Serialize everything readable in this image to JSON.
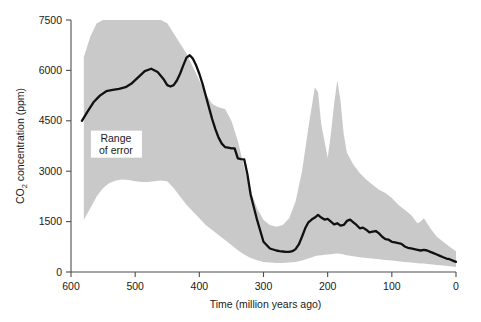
{
  "chart_data": {
    "type": "area",
    "title": "",
    "xlabel": "Time (million years ago)",
    "ylabel": "CO2 concentration (ppm)",
    "ylabel_parts": {
      "prefix": "CO",
      "sub": "2",
      "suffix": " concentration (ppm)"
    },
    "xlim": [
      600,
      0
    ],
    "ylim": [
      0,
      7500
    ],
    "x_reversed": true,
    "grid": false,
    "legend": "none",
    "xticks": [
      600,
      500,
      400,
      300,
      200,
      100,
      0
    ],
    "xtick_labels": [
      "600",
      "500",
      "400",
      "300",
      "200",
      "100",
      "0"
    ],
    "yticks": [
      0,
      1500,
      3000,
      4500,
      6000,
      7500
    ],
    "ytick_labels": [
      "0",
      "1500",
      "3000",
      "4500",
      "6000",
      "7500"
    ],
    "annotations": [
      {
        "text_line1": "Range",
        "text_line2": "of error",
        "x": 530,
        "y": 3850
      }
    ],
    "series": [
      {
        "name": "CO2 concentration (best estimate)",
        "color": "#111111",
        "x": [
          583,
          575,
          565,
          555,
          545,
          535,
          525,
          515,
          505,
          495,
          485,
          475,
          465,
          455,
          450,
          445,
          440,
          435,
          430,
          425,
          420,
          415,
          410,
          405,
          400,
          395,
          390,
          385,
          380,
          375,
          370,
          365,
          360,
          355,
          350,
          345,
          340,
          335,
          330,
          325,
          320,
          310,
          300,
          290,
          280,
          275,
          270,
          265,
          260,
          255,
          250,
          245,
          240,
          235,
          230,
          225,
          220,
          215,
          210,
          205,
          200,
          195,
          190,
          185,
          180,
          175,
          170,
          165,
          160,
          155,
          150,
          145,
          140,
          135,
          130,
          125,
          120,
          115,
          110,
          105,
          100,
          95,
          90,
          85,
          80,
          75,
          70,
          65,
          60,
          55,
          50,
          45,
          40,
          35,
          30,
          25,
          20,
          15,
          10,
          5,
          0
        ],
        "values": [
          4500,
          4750,
          5050,
          5250,
          5380,
          5420,
          5450,
          5500,
          5620,
          5800,
          5980,
          6050,
          5950,
          5720,
          5560,
          5520,
          5560,
          5700,
          5900,
          6150,
          6380,
          6450,
          6350,
          6150,
          5900,
          5600,
          5250,
          4900,
          4550,
          4250,
          4000,
          3820,
          3720,
          3700,
          3680,
          3680,
          3380,
          3360,
          3350,
          2900,
          2300,
          1550,
          900,
          700,
          640,
          620,
          610,
          600,
          600,
          620,
          680,
          820,
          1050,
          1300,
          1480,
          1560,
          1620,
          1700,
          1620,
          1560,
          1580,
          1500,
          1420,
          1450,
          1380,
          1400,
          1520,
          1560,
          1480,
          1400,
          1300,
          1320,
          1260,
          1180,
          1200,
          1220,
          1150,
          1050,
          980,
          960,
          900,
          880,
          860,
          840,
          760,
          720,
          700,
          680,
          660,
          640,
          660,
          640,
          600,
          560,
          520,
          480,
          440,
          400,
          380,
          340,
          300
        ]
      }
    ],
    "band": {
      "name": "Range of error",
      "color": "#c9c9c9",
      "x": [
        580,
        570,
        560,
        550,
        540,
        530,
        520,
        510,
        500,
        490,
        480,
        470,
        460,
        450,
        440,
        430,
        420,
        410,
        400,
        390,
        380,
        370,
        360,
        350,
        340,
        330,
        320,
        310,
        300,
        290,
        280,
        270,
        260,
        250,
        240,
        230,
        220,
        215,
        210,
        205,
        200,
        195,
        190,
        185,
        180,
        175,
        170,
        160,
        150,
        140,
        130,
        120,
        110,
        100,
        90,
        80,
        70,
        60,
        55,
        50,
        45,
        40,
        30,
        20,
        10,
        0
      ],
      "upper": [
        6400,
        7000,
        7400,
        7500,
        7500,
        7500,
        7500,
        7500,
        7500,
        7500,
        7500,
        7500,
        7500,
        7400,
        7100,
        6800,
        6500,
        6100,
        5700,
        5300,
        5000,
        4900,
        4850,
        4500,
        3900,
        3100,
        2400,
        1900,
        1550,
        1400,
        1350,
        1400,
        1600,
        2100,
        3000,
        4300,
        5500,
        5350,
        4400,
        3900,
        3400,
        4100,
        5000,
        5700,
        5100,
        4100,
        3550,
        3200,
        2950,
        2750,
        2600,
        2450,
        2350,
        2200,
        2000,
        1850,
        1700,
        1450,
        1500,
        1600,
        1450,
        1300,
        1050,
        900,
        750,
        620
      ],
      "lower": [
        1550,
        1900,
        2250,
        2500,
        2650,
        2720,
        2750,
        2740,
        2700,
        2680,
        2680,
        2700,
        2720,
        2700,
        2500,
        2250,
        2000,
        1800,
        1600,
        1400,
        1250,
        1100,
        950,
        800,
        650,
        520,
        420,
        350,
        300,
        280,
        270,
        270,
        280,
        300,
        340,
        400,
        470,
        490,
        500,
        510,
        520,
        530,
        540,
        550,
        540,
        520,
        500,
        470,
        440,
        420,
        400,
        380,
        360,
        340,
        320,
        300,
        280,
        260,
        250,
        250,
        240,
        230,
        210,
        190,
        170,
        150
      ]
    }
  }
}
